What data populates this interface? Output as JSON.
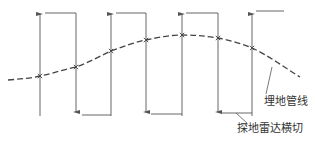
{
  "labels": {
    "pipeline": "埋地管线",
    "radar_transect": "探地雷达横切"
  },
  "diagram": {
    "line_color": "#555555",
    "pipe_color": "#444444",
    "traverse_count": 7,
    "traverse_directions": [
      "up",
      "down",
      "up",
      "down",
      "up",
      "down",
      "up"
    ],
    "intersection_count": 7
  }
}
